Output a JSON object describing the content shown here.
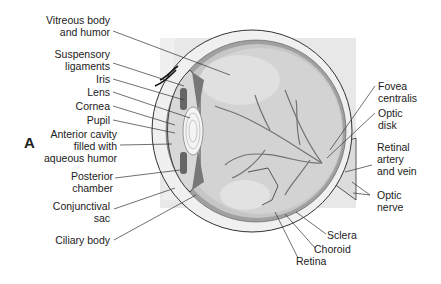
{
  "figure": {
    "panel_letter": "A",
    "colors": {
      "background": "#ffffff",
      "panel": "#e6e6e6",
      "vitreous": "#cfcfcf",
      "sclera": "#ededed",
      "choroid": "#9a9a9a",
      "retina": "#bdbdbd",
      "vessels": "#6e6e6e",
      "lines": "#333333",
      "text": "#222222"
    }
  },
  "labels_left": [
    {
      "line1": "Vitreous body",
      "line2": "and humor"
    },
    {
      "line1": "Suspensory",
      "line2": "ligaments"
    },
    {
      "line1": "Iris"
    },
    {
      "line1": "Lens"
    },
    {
      "line1": "Cornea"
    },
    {
      "line1": "Pupil"
    },
    {
      "line1": "Anterior cavity",
      "line2": "filled with",
      "line3": "aqueous humor"
    },
    {
      "line1": "Posterior",
      "line2": "chamber"
    },
    {
      "line1": "Conjunctival",
      "line2": "sac"
    },
    {
      "line1": "Ciliary body"
    }
  ],
  "labels_right": [
    {
      "line1": "Fovea",
      "line2": "centralis"
    },
    {
      "line1": "Optic",
      "line2": "disk"
    },
    {
      "line1": "Retinal",
      "line2": "artery",
      "line3": "and vein"
    },
    {
      "line1": "Optic",
      "line2": "nerve"
    }
  ],
  "labels_bottom": [
    {
      "line1": "Sclera"
    },
    {
      "line1": "Choroid"
    },
    {
      "line1": "Retina"
    }
  ]
}
